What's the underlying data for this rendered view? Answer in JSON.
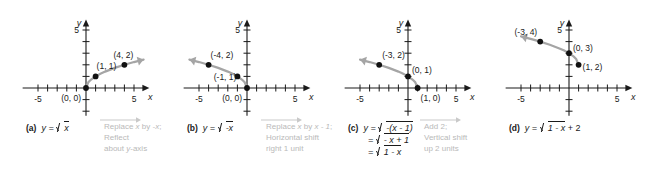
{
  "figure": {
    "axis": {
      "x_label": "x",
      "y_label": "y",
      "x_tick_neg": "-5",
      "x_tick_pos": "5",
      "y_tick_pos": "5",
      "x_min": -6.6,
      "x_max": 6.6,
      "y_min": -2.4,
      "y_max": 5.9,
      "tick_values_x": [
        -5,
        -4,
        -3,
        -2,
        -1,
        1,
        2,
        3,
        4,
        5
      ],
      "tick_values_y": [
        1,
        2,
        3,
        4,
        5
      ],
      "grid": false
    },
    "colors": {
      "curve": "#a5a5a5",
      "point": "#111111",
      "axis": "#1a1a1a",
      "annotation": "#b9b9b9"
    }
  },
  "panels": [
    {
      "id": "a",
      "tag": "(a)",
      "equation_lines": [
        {
          "lhs": "y =",
          "radicand": "x",
          "suffix": ""
        }
      ],
      "equation_plain": "y = √x",
      "points": [
        {
          "label": "(0, 0)",
          "x": 0,
          "y": 0
        },
        {
          "label": "(1, 1)",
          "x": 1,
          "y": 1
        },
        {
          "label": "(4, 2)",
          "x": 4,
          "y": 2
        }
      ],
      "curve_direction": "right",
      "chart_data": {
        "type": "line",
        "title": "y = sqrt(x)",
        "xlabel": "x",
        "ylabel": "y",
        "xlim": [
          -6.6,
          6.6
        ],
        "ylim": [
          -2.4,
          5.9
        ],
        "x": [
          0,
          0.25,
          0.5,
          1,
          1.5,
          2,
          3,
          4,
          5,
          6
        ],
        "y": [
          0,
          0.5,
          0.707,
          1,
          1.225,
          1.414,
          1.732,
          2,
          2.236,
          2.449
        ],
        "marked_points": [
          [
            0,
            0
          ],
          [
            1,
            1
          ],
          [
            4,
            2
          ]
        ]
      }
    },
    {
      "id": "b",
      "tag": "(b)",
      "equation_lines": [
        {
          "lhs": "y =",
          "radicand": "-x",
          "suffix": ""
        }
      ],
      "equation_plain": "y = √(-x)",
      "points": [
        {
          "label": "(-4, 2)",
          "x": -4,
          "y": 2
        },
        {
          "label": "(-1, 1)",
          "x": -1,
          "y": 1
        },
        {
          "label": "(0, 0)",
          "x": 0,
          "y": 0
        }
      ],
      "curve_direction": "left",
      "chart_data": {
        "type": "line",
        "title": "y = sqrt(-x)",
        "xlabel": "x",
        "ylabel": "y",
        "xlim": [
          -6.6,
          6.6
        ],
        "ylim": [
          -2.4,
          5.9
        ],
        "x": [
          0,
          -0.25,
          -0.5,
          -1,
          -1.5,
          -2,
          -3,
          -4,
          -5,
          -6
        ],
        "y": [
          0,
          0.5,
          0.707,
          1,
          1.225,
          1.414,
          1.732,
          2,
          2.236,
          2.449
        ],
        "marked_points": [
          [
            0,
            0
          ],
          [
            -1,
            1
          ],
          [
            -4,
            2
          ]
        ]
      }
    },
    {
      "id": "c",
      "tag": "(c)",
      "equation_lines": [
        {
          "lhs": "y =",
          "radicand": "-(x - 1)",
          "suffix": ""
        },
        {
          "lhs": "=",
          "radicand": "- x + 1",
          "suffix": ""
        },
        {
          "lhs": "=",
          "radicand": "1 - x",
          "suffix": ""
        }
      ],
      "equation_plain": "y = √(-(x - 1)) = √(-x + 1) = √(1 - x)",
      "points": [
        {
          "label": "(-3, 2)",
          "x": -3,
          "y": 2
        },
        {
          "label": "(0, 1)",
          "x": 0,
          "y": 1
        },
        {
          "label": "(1, 0)",
          "x": 1,
          "y": 0
        }
      ],
      "curve_direction": "left",
      "chart_data": {
        "type": "line",
        "title": "y = sqrt(1 - x)",
        "xlabel": "x",
        "ylabel": "y",
        "xlim": [
          -6.6,
          6.6
        ],
        "ylim": [
          -2.4,
          5.9
        ],
        "x": [
          1,
          0.75,
          0.5,
          0,
          -0.5,
          -1,
          -2,
          -3,
          -4,
          -5
        ],
        "y": [
          0,
          0.5,
          0.707,
          1,
          1.225,
          1.414,
          1.732,
          2,
          2.236,
          2.449
        ],
        "marked_points": [
          [
            1,
            0
          ],
          [
            0,
            1
          ],
          [
            -3,
            2
          ]
        ]
      }
    },
    {
      "id": "d",
      "tag": "(d)",
      "equation_lines": [
        {
          "lhs": "y =",
          "radicand": "1 - x",
          "suffix": "+ 2"
        }
      ],
      "equation_plain": "y = √(1 - x) + 2",
      "points": [
        {
          "label": "(-3, 4)",
          "x": -3,
          "y": 4
        },
        {
          "label": "(0, 3)",
          "x": 0,
          "y": 3
        },
        {
          "label": "(1, 2)",
          "x": 1,
          "y": 2
        }
      ],
      "curve_direction": "left",
      "chart_data": {
        "type": "line",
        "title": "y = sqrt(1 - x) + 2",
        "xlabel": "x",
        "ylabel": "y",
        "xlim": [
          -6.6,
          6.6
        ],
        "ylim": [
          -2.4,
          5.9
        ],
        "x": [
          1,
          0.75,
          0.5,
          0,
          -0.5,
          -1,
          -2,
          -3,
          -4,
          -5
        ],
        "y": [
          2,
          2.5,
          2.707,
          3,
          3.225,
          3.414,
          3.732,
          4,
          4.236,
          4.449
        ],
        "marked_points": [
          [
            1,
            2
          ],
          [
            0,
            3
          ],
          [
            -3,
            4
          ]
        ]
      }
    }
  ],
  "annotations": [
    {
      "id": "a-to-b",
      "line1_pre": "Replace ",
      "line1_var": "x",
      "line1_mid": " by ",
      "line1_expr": "-x",
      "line1_post": ";",
      "line2": "Reflect",
      "line3_pre": "about ",
      "line3_var": "y",
      "line3_post": "-axis"
    },
    {
      "id": "b-to-c",
      "line1_pre": "Replace ",
      "line1_var": "x",
      "line1_mid": " by ",
      "line1_expr": "x - 1",
      "line1_post": ";",
      "line2": "Horizontal shift",
      "line3_pre": "right 1 unit",
      "line3_var": "",
      "line3_post": ""
    },
    {
      "id": "c-to-d",
      "line1_pre": "Add 2;",
      "line1_var": "",
      "line1_mid": "",
      "line1_expr": "",
      "line1_post": "",
      "line2": "Vertical shift",
      "line3_pre": "up 2 units",
      "line3_var": "",
      "line3_post": ""
    }
  ]
}
